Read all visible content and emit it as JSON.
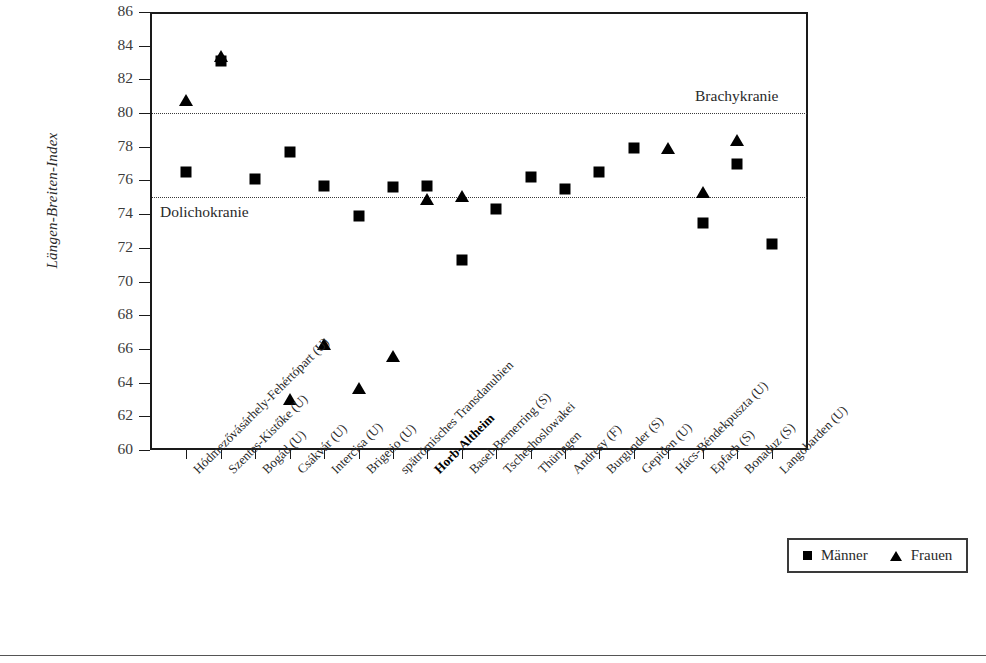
{
  "chart_data": {
    "type": "scatter",
    "title": "",
    "xlabel": "",
    "ylabel": "Längen-Breiten-Index",
    "ylim": [
      60,
      86
    ],
    "ytick_step": 2,
    "yticks": [
      86,
      84,
      82,
      80,
      78,
      76,
      74,
      72,
      70,
      68,
      66,
      64,
      62,
      60
    ],
    "grid": false,
    "legend_position": "bottom-right",
    "categories": [
      "Hódmezővásárhely-Fehértópart (U)",
      "Szentes-Kistőke (U)",
      "Bogád (U)",
      "Csákvár (U)",
      "Intercisa (U)",
      "Brigetio (U)",
      "spätrömisches Transdanubien",
      "Horb-Altheim",
      "Basel-Bernerring (S)",
      "Tschechoslowakei",
      "Thüringen",
      "Andresy (F)",
      "Burgunder (S)",
      "Gepiden (U)",
      "Hács-Béndekpuszta (U)",
      "Epfach (S)",
      "Bonaduz (S)",
      "Langobarden (U)"
    ],
    "highlighted_category": "Horb-Altheim",
    "series": [
      {
        "name": "Männer",
        "marker": "square",
        "color": "#000000",
        "values": [
          76.5,
          83.1,
          76.1,
          77.7,
          75.7,
          73.9,
          75.6,
          75.7,
          71.3,
          74.3,
          76.2,
          75.5,
          76.5,
          77.9,
          null,
          73.5,
          77.0,
          72.2
        ]
      },
      {
        "name": "Frauen",
        "marker": "triangle",
        "color": "#000000",
        "values": [
          80.8,
          83.4,
          null,
          63.0,
          66.3,
          63.7,
          65.6,
          74.9,
          75.1,
          null,
          null,
          null,
          null,
          null,
          77.9,
          75.3,
          78.4,
          null
        ]
      }
    ],
    "reference_lines": [
      {
        "value": 80,
        "label": "Brachykranie",
        "label_side": "right",
        "label_position": "above",
        "style": "dotted"
      },
      {
        "value": 75,
        "label": "Dolichokranie",
        "label_side": "left",
        "label_position": "below",
        "style": "dotted"
      }
    ]
  },
  "legend": {
    "entries": [
      {
        "label": "Männer",
        "marker": "square"
      },
      {
        "label": "Frauen",
        "marker": "triangle"
      }
    ]
  }
}
